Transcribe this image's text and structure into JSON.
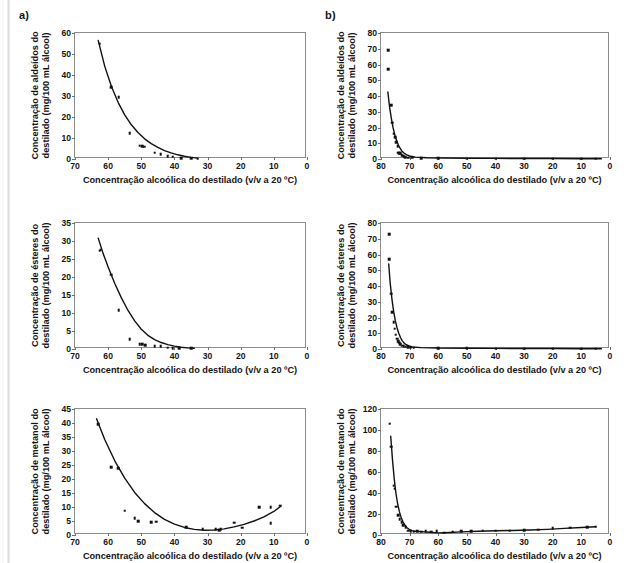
{
  "figure": {
    "panel_a_label": "a)",
    "panel_b_label": "b)",
    "xaxis_title": "Concentração alcoólica do destilado (v/v a 20 ºC)"
  },
  "chart_data": [
    {
      "id": "a1",
      "panel": "a)",
      "type": "scatter",
      "title": "",
      "xlabel": "Concentração alcoólica do destilado (v/v a 20 ºC)",
      "ylabel_line1": "Concentração de aldeídos do",
      "ylabel_line2": "destilado (mg/100 mL álcool)",
      "xlim": [
        70,
        0
      ],
      "ylim": [
        0,
        60
      ],
      "xticks": [
        70,
        60,
        50,
        40,
        30,
        20,
        10,
        0
      ],
      "yticks": [
        0,
        10,
        20,
        30,
        40,
        50,
        60
      ],
      "grid": false,
      "legend": "none",
      "x": [
        62.5,
        59.0,
        56.8,
        53.5,
        50.5,
        49.8,
        49.2,
        46.0,
        44.2,
        42.0,
        40.5,
        38.0,
        35.0,
        33.0
      ],
      "y": [
        55.0,
        34.2,
        29.3,
        12.3,
        6.3,
        6.0,
        5.9,
        3.0,
        2.3,
        1.4,
        1.0,
        0.5,
        0.3,
        0.2
      ],
      "fit_x": [
        63.0,
        61.0,
        59.0,
        57.0,
        55.0,
        53.0,
        51.0,
        49.0,
        47.0,
        45.0,
        43.0,
        41.0,
        39.0,
        37.0,
        35.0,
        33.0
      ],
      "fit_y": [
        56.5,
        44.0,
        34.5,
        27.0,
        21.0,
        16.3,
        12.6,
        9.6,
        7.3,
        5.5,
        4.0,
        2.9,
        2.0,
        1.3,
        0.8,
        0.4
      ]
    },
    {
      "id": "b1",
      "panel": "b)",
      "type": "scatter",
      "title": "",
      "xlabel": "Concentração alcoólica do destilado (v/v a 20 ºC)",
      "ylabel_line1": "Concentração de aldeídos do",
      "ylabel_line2": "destilado (mg/100 mL álcool)",
      "xlim": [
        80,
        0
      ],
      "ylim": [
        0,
        80
      ],
      "xticks": [
        80,
        70,
        60,
        50,
        40,
        30,
        20,
        10,
        0
      ],
      "yticks": [
        0,
        10,
        20,
        30,
        40,
        50,
        60,
        70,
        80
      ],
      "grid": false,
      "legend": "none",
      "x": [
        77.5,
        77.5,
        76.5,
        76.0,
        75.5,
        75.0,
        74.6,
        74.2,
        74.0,
        73.6,
        73.2,
        72.8,
        72.4,
        72.0,
        71.5,
        70.5,
        69.0,
        66.0,
        60.0,
        50.0,
        40.0,
        30.0,
        20.0,
        10.0,
        5.0
      ],
      "y": [
        69.0,
        57.0,
        34.0,
        23.0,
        16.0,
        14.0,
        10.5,
        8.0,
        4.0,
        3.8,
        3.6,
        2.5,
        2.0,
        1.6,
        1.2,
        0.9,
        0.7,
        0.5,
        0.4,
        0.3,
        0.25,
        0.2,
        0.2,
        0.15,
        0.1
      ],
      "fit_x": [
        77.6,
        77.0,
        76.4,
        75.8,
        75.2,
        74.6,
        74.0,
        73.4,
        72.8,
        72.0,
        71.0,
        70.0,
        68.0,
        64.0,
        58.0,
        50.0,
        40.0,
        30.0,
        20.0,
        10.0,
        3.0
      ],
      "fit_y": [
        42.5,
        33.0,
        26.0,
        20.0,
        15.5,
        12.0,
        9.2,
        7.0,
        5.3,
        3.8,
        2.6,
        1.9,
        1.2,
        0.8,
        0.6,
        0.5,
        0.4,
        0.3,
        0.3,
        0.2,
        0.2
      ]
    },
    {
      "id": "a2",
      "panel": "a)",
      "type": "scatter",
      "title": "",
      "xlabel": "Concentração alcoólica do destilado (v/v a 20 ºC)",
      "ylabel_line1": "Concentração de ésteres do",
      "ylabel_line2": "destilado (mg/100 mL álcool)",
      "xlim": [
        70,
        0
      ],
      "ylim": [
        0,
        35
      ],
      "xticks": [
        70,
        60,
        50,
        40,
        30,
        20,
        10,
        0
      ],
      "yticks": [
        0,
        5,
        10,
        15,
        20,
        25,
        30,
        35
      ],
      "grid": false,
      "legend": "none",
      "x": [
        62.5,
        62.2,
        59.0,
        56.8,
        53.5,
        50.5,
        49.8,
        48.8,
        46.0,
        44.2,
        42.0,
        40.5,
        38.5,
        35.0
      ],
      "y": [
        27.3,
        27.6,
        20.6,
        10.7,
        2.7,
        1.4,
        1.3,
        1.1,
        0.8,
        0.7,
        0.4,
        0.3,
        0.2,
        0.15
      ],
      "fit_x": [
        63.0,
        61.5,
        60.0,
        58.0,
        56.0,
        54.0,
        52.0,
        50.0,
        48.0,
        46.0,
        44.0,
        42.0,
        40.0,
        38.0,
        36.0,
        34.0
      ],
      "fit_y": [
        30.8,
        26.5,
        22.8,
        18.2,
        14.2,
        10.7,
        7.8,
        5.5,
        3.8,
        2.6,
        1.8,
        1.2,
        0.8,
        0.5,
        0.3,
        0.2
      ]
    },
    {
      "id": "b2",
      "panel": "b)",
      "type": "scatter",
      "title": "",
      "xlabel": "Concentração alcoólica do destilado (v/v a 20 ºC)",
      "ylabel_line1": "Concentração de ésteres do",
      "ylabel_line2": "destilado (mg/100 mL álcool)",
      "xlim": [
        80,
        0
      ],
      "ylim": [
        0,
        80
      ],
      "xticks": [
        80,
        70,
        60,
        50,
        40,
        30,
        20,
        10,
        0
      ],
      "yticks": [
        0,
        10,
        20,
        30,
        40,
        50,
        60,
        70,
        80
      ],
      "grid": false,
      "legend": "none",
      "x": [
        77.2,
        77.2,
        76.4,
        76.0,
        75.6,
        75.2,
        74.8,
        74.4,
        74.0,
        73.6,
        73.2,
        72.6,
        72.0,
        71.4,
        70.6,
        69.6,
        68.6,
        60.0,
        50.0,
        40.0,
        30.0,
        20.0,
        10.0,
        5.0
      ],
      "y": [
        73.0,
        57.0,
        35.0,
        23.5,
        17.0,
        13.0,
        9.0,
        6.5,
        5.0,
        4.0,
        3.0,
        2.2,
        1.8,
        1.4,
        1.1,
        0.9,
        0.8,
        0.5,
        0.4,
        0.3,
        0.25,
        0.2,
        0.15,
        0.1
      ],
      "fit_x": [
        77.3,
        76.8,
        76.2,
        75.6,
        75.0,
        74.4,
        73.8,
        73.2,
        72.6,
        72.0,
        71.2,
        70.2,
        69.0,
        66.0,
        60.0,
        50.0,
        40.0,
        30.0,
        20.0,
        10.0,
        3.0
      ],
      "fit_y": [
        54.0,
        42.0,
        32.0,
        24.0,
        18.0,
        13.5,
        10.0,
        7.3,
        5.3,
        3.9,
        2.7,
        1.9,
        1.3,
        0.9,
        0.6,
        0.5,
        0.4,
        0.3,
        0.3,
        0.2,
        0.2
      ]
    },
    {
      "id": "a3",
      "panel": "a)",
      "type": "scatter",
      "title": "",
      "xlabel": "Concentração alcoólica do destilado (v/v a 20 ºC)",
      "ylabel_line1": "Concentração de metanol do",
      "ylabel_line2": "destilado (mg/100 mL álcool)",
      "xlim": [
        70,
        0
      ],
      "ylim": [
        0,
        45
      ],
      "xticks": [
        70,
        60,
        50,
        40,
        30,
        20,
        10,
        0
      ],
      "yticks": [
        0,
        5,
        10,
        15,
        20,
        25,
        30,
        35,
        40,
        45
      ],
      "grid": false,
      "legend": "none",
      "x": [
        63.0,
        59.0,
        57.0,
        55.0,
        52.0,
        51.0,
        47.0,
        45.5,
        36.5,
        31.5,
        27.5,
        26.5,
        26.0,
        22.0,
        19.5,
        14.5,
        11.0,
        11.0,
        8.0
      ],
      "y": [
        39.6,
        24.3,
        23.8,
        8.7,
        6.1,
        5.0,
        4.6,
        4.7,
        2.8,
        2.0,
        2.1,
        1.8,
        2.0,
        4.4,
        2.6,
        10.0,
        10.0,
        4.3,
        10.5
      ],
      "fit_x": [
        63.5,
        61.0,
        58.0,
        55.0,
        52.0,
        49.0,
        46.0,
        43.0,
        40.0,
        37.0,
        34.0,
        31.0,
        28.0,
        25.0,
        22.0,
        19.0,
        16.0,
        13.0,
        10.0,
        8.0
      ],
      "fit_y": [
        41.5,
        34.0,
        26.5,
        20.3,
        15.2,
        11.2,
        8.0,
        5.6,
        3.9,
        2.7,
        2.0,
        1.7,
        1.8,
        2.2,
        2.9,
        3.8,
        5.0,
        6.5,
        8.4,
        10.2
      ]
    },
    {
      "id": "b3",
      "panel": "b)",
      "type": "scatter",
      "title": "",
      "xlabel": "Concentração alcoólica do destilado (v/v a 20 ºC)",
      "ylabel_line1": "Concentração de metanol do",
      "ylabel_line2": "destilado (mg/100 mL álcool)",
      "xlim": [
        80,
        0
      ],
      "ylim": [
        0,
        120
      ],
      "xticks": [
        80,
        70,
        60,
        50,
        40,
        30,
        20,
        10,
        0
      ],
      "yticks": [
        0,
        20,
        40,
        60,
        80,
        100,
        120
      ],
      "grid": false,
      "legend": "none",
      "x": [
        77.0,
        76.4,
        75.6,
        75.2,
        74.6,
        74.0,
        73.4,
        72.8,
        72.2,
        71.4,
        70.6,
        69.6,
        68.6,
        67.4,
        66.0,
        64.4,
        62.5,
        60.5,
        58.0,
        55.0,
        52.0,
        48.5,
        44.5,
        40.0,
        35.0,
        30.0,
        25.0,
        20.0,
        14.0,
        8.0,
        5.0
      ],
      "y": [
        106.0,
        84.0,
        47.0,
        44.0,
        27.0,
        19.0,
        15.0,
        12.0,
        9.5,
        7.5,
        4.0,
        3.5,
        3.3,
        3.4,
        3.3,
        3.5,
        3.2,
        3.6,
        2.2,
        3.0,
        3.5,
        3.8,
        4.0,
        4.2,
        4.2,
        4.6,
        5.0,
        6.5,
        7.0,
        7.6,
        8.0
      ],
      "fit_x": [
        76.6,
        76.0,
        75.4,
        74.8,
        74.2,
        73.6,
        73.0,
        72.4,
        71.8,
        71.0,
        70.2,
        69.2,
        68.0,
        66.0,
        63.0,
        60.0,
        56.0,
        52.0,
        46.0,
        40.0,
        34.0,
        28.0,
        22.0,
        16.0,
        10.0,
        5.0
      ],
      "fit_y": [
        94.0,
        72.0,
        54.0,
        40.0,
        30.0,
        22.5,
        17.0,
        13.0,
        10.0,
        7.2,
        5.4,
        4.2,
        3.6,
        3.2,
        2.6,
        2.0,
        2.4,
        3.0,
        3.6,
        4.0,
        4.3,
        4.7,
        5.4,
        6.3,
        7.2,
        7.9
      ]
    }
  ]
}
